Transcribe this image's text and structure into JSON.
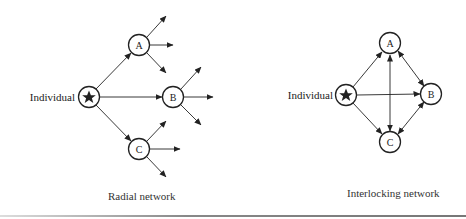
{
  "radial": {
    "individual_label": "Individual",
    "nodes": {
      "a": "A",
      "b": "B",
      "c": "C"
    },
    "caption": "Radial network"
  },
  "interlocking": {
    "individual_label": "Individual",
    "nodes": {
      "a": "A",
      "b": "B",
      "c": "C"
    },
    "caption": "Interlocking network"
  },
  "colors": {
    "ink": "#222222",
    "background": "#ffffff"
  }
}
